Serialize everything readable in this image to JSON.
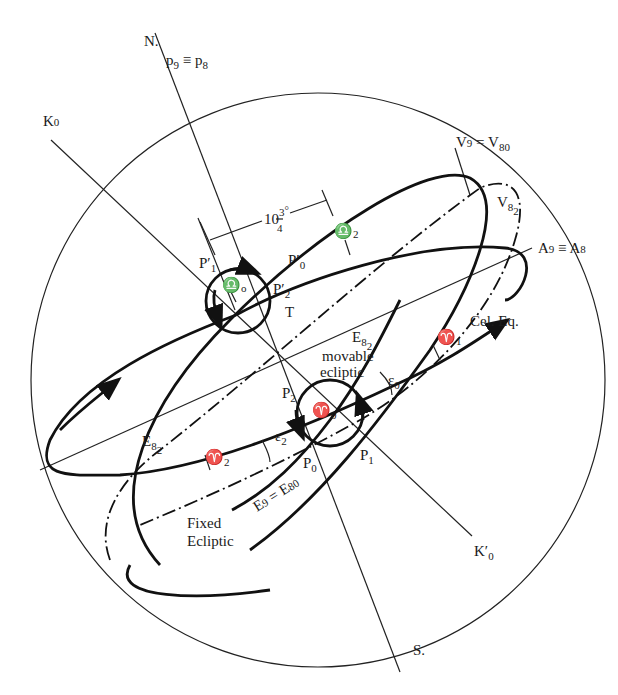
{
  "figure": {
    "colors": {
      "line": "#111111",
      "background": "#ffffff"
    }
  },
  "labels": {
    "north": "N.",
    "south": "S.",
    "pole_p9_p8": {
      "base": "p",
      "s1": "9",
      "mid": " ≡ p",
      "s2": "8"
    },
    "k0": {
      "base": "K",
      "sub": "0"
    },
    "k0_prime": {
      "base": "K′",
      "sub": "0"
    },
    "v9_v80": {
      "base": "V",
      "s1": "9",
      "mid": " = V",
      "s2": "8",
      "s3": "0"
    },
    "v82": {
      "base": "V",
      "s1": "8",
      "s2": "2"
    },
    "a9_a8": {
      "base": "A",
      "s1": "9",
      "mid": " ≡ A",
      "s2": "8"
    },
    "angle_10_3_4": {
      "whole": "10",
      "num": "3",
      "den": "4",
      "deg": "°"
    },
    "p1_prime": {
      "base": "P′",
      "sub": "1"
    },
    "p0_prime": {
      "base": "P′",
      "sub": "0"
    },
    "p2_prime": {
      "base": "P′",
      "sub": "2"
    },
    "libra_0": {
      "base": "♎",
      "sub": "o"
    },
    "libra_2": {
      "base": "♎",
      "sub": "2"
    },
    "t": "T",
    "e82_upper": {
      "base": "E",
      "s1": "8",
      "s2": "2"
    },
    "movable_ecliptic": [
      "movable",
      "ecliptic"
    ],
    "cel_eq": "Cel. Eq.",
    "aries_1": {
      "base": "♈",
      "sub": "1"
    },
    "aries_0": {
      "base": "♈",
      "sub": "0"
    },
    "aries_2": {
      "base": "♈",
      "sub": "2"
    },
    "epsilon_0": {
      "base": "ε",
      "sub": "0"
    },
    "epsilon_2": {
      "base": "ε",
      "sub": "2"
    },
    "p2": {
      "base": "P",
      "sub": "2"
    },
    "p0": {
      "base": "P",
      "sub": "0"
    },
    "p1": {
      "base": "P",
      "sub": "1"
    },
    "e82_lower": {
      "base": "E",
      "s1": "8",
      "s2": "2"
    },
    "e9_e80": {
      "base": "E",
      "s1": "9",
      "mid": " = E",
      "s2": "80"
    },
    "fixed_ecliptic": [
      "Fixed",
      "Ecliptic"
    ]
  }
}
